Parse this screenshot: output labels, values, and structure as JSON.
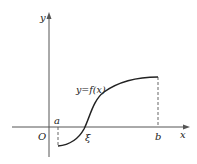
{
  "figure": {
    "type": "function-graph",
    "axes": {
      "x_label": "x",
      "y_label": "y",
      "origin_label": "O"
    },
    "points": {
      "a_label": "a",
      "b_label": "b",
      "xi_label": "ξ"
    },
    "curve_label": "y=f(x)",
    "colors": {
      "stroke": "#222222",
      "axis": "#555555",
      "background": "#ffffff"
    }
  }
}
